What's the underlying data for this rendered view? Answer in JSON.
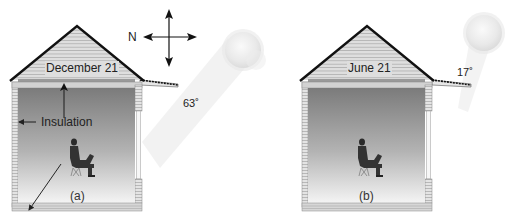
{
  "panels": [
    {
      "id": "a",
      "date_label": "December 21",
      "sun_angle_label": "63˚",
      "insulation_label": "Insulation",
      "caption": "(a)"
    },
    {
      "id": "b",
      "date_label": "June 21",
      "sun_angle_label": "17˚",
      "caption": "(b)"
    }
  ],
  "compass": {
    "north_label": "N",
    "icon": "compass-cross-arrows-icon"
  },
  "colors": {
    "roof_edge": "#111111",
    "siding": "#d8d8d8",
    "siding_line": "#a8a8a8",
    "interior_top": "#7a7a7a",
    "interior_bottom": "#f2f2f2",
    "sun": "#e6e6e6",
    "beam": "#f0f0f0"
  }
}
